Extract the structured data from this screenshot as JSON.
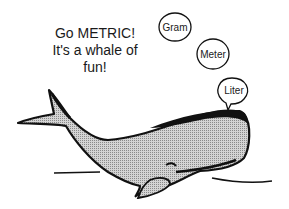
{
  "caption": {
    "line1": "Go METRIC!",
    "line2": "It's a whale of",
    "line3": "fun!"
  },
  "bubbles": [
    {
      "label": "Gram"
    },
    {
      "label": "Meter"
    },
    {
      "label": "Liter"
    }
  ],
  "colors": {
    "ink": "#111111",
    "body_fill": "#c8c8c8",
    "background": "#ffffff"
  }
}
